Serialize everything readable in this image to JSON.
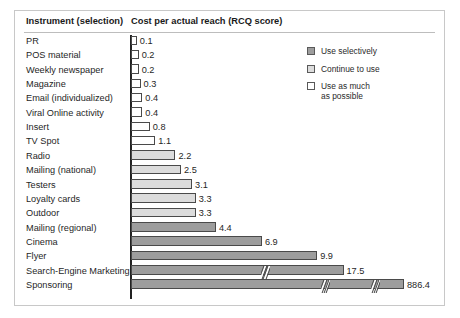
{
  "chart_data": {
    "type": "bar",
    "orientation": "horizontal",
    "title": "",
    "columns": [
      "Instrument (selection)",
      "Cost per actual reach (RCQ score)"
    ],
    "xlabel": "Cost per actual reach (RCQ score)",
    "ylabel": "Instrument (selection)",
    "grid": false,
    "legend_position": "top-right",
    "axis_breaks": true,
    "categories": [
      "PR",
      "POS material",
      "Weekly newspaper",
      "Magazine",
      "Email (individualized)",
      "Viral Online activity",
      "Insert",
      "TV Spot",
      "Radio",
      "Mailing (national)",
      "Testers",
      "Loyalty cards",
      "Outdoor",
      "Mailing (regional)",
      "Cinema",
      "Flyer",
      "Search-Engine Marketing",
      "Sponsoring"
    ],
    "values": [
      0.1,
      0.2,
      0.2,
      0.3,
      0.4,
      0.4,
      0.8,
      1.1,
      2.2,
      2.5,
      3.1,
      3.3,
      3.3,
      4.4,
      6.9,
      9.9,
      17.5,
      886.4
    ],
    "value_labels": [
      "0.1",
      "0.2",
      "0.2",
      "0.3",
      "0.4",
      "0.4",
      "0.8",
      "1.1",
      "2.2",
      "2.5",
      "3.1",
      "3.3",
      "3.3",
      "4.4",
      "6.9",
      "9.9",
      "17.5",
      "886.4"
    ],
    "groups": [
      "use-as-much-as-possible",
      "use-as-much-as-possible",
      "use-as-much-as-possible",
      "use-as-much-as-possible",
      "use-as-much-as-possible",
      "use-as-much-as-possible",
      "use-as-much-as-possible",
      "use-as-much-as-possible",
      "continue-to-use",
      "continue-to-use",
      "continue-to-use",
      "continue-to-use",
      "continue-to-use",
      "use-selectively",
      "use-selectively",
      "use-selectively",
      "use-selectively",
      "use-selectively"
    ],
    "legend": [
      {
        "key": "use-selectively",
        "label": "Use selectively",
        "color": "#9d9d9d"
      },
      {
        "key": "continue-to-use",
        "label": "Continue to use",
        "color": "#dcdcdc"
      },
      {
        "key": "use-as-much-as-possible",
        "label": "Use as much as possible",
        "label_line1": "Use as much",
        "label_line2": "as possible",
        "color": "#ffffff"
      }
    ]
  },
  "header": {
    "instrument": "Instrument (selection)",
    "cost": "Cost per actual reach (RCQ score)"
  },
  "legend": {
    "items": [
      {
        "label": "Use selectively"
      },
      {
        "label": "Continue to use"
      },
      {
        "label_line1": "Use as much",
        "label_line2": "as possible"
      }
    ]
  },
  "colors": {
    "use_selectively": "#9d9d9d",
    "continue_to_use": "#dcdcdc",
    "use_as_much": "#ffffff",
    "bar_border": "#4a4a4a",
    "axis": "#222222",
    "frame": "#c8c8c8",
    "text": "#1f1f1f"
  }
}
